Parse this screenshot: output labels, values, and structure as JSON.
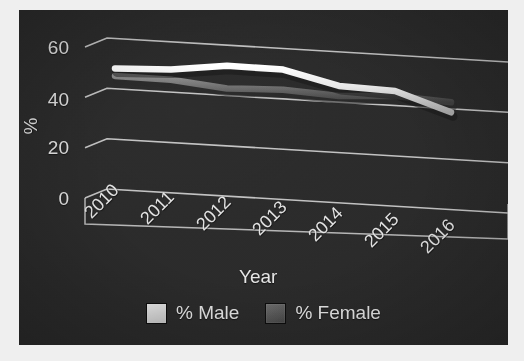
{
  "chart_data": {
    "type": "line",
    "title": "",
    "subtitle": "",
    "xlabel": "Year",
    "ylabel": "%",
    "categories": [
      "2010",
      "2011",
      "2012",
      "2013",
      "2014",
      "2015",
      "2016"
    ],
    "ylim": [
      0,
      60
    ],
    "yticks": [
      0,
      20,
      40,
      60
    ],
    "ytick_labels": [
      "0",
      "20",
      "40",
      "60"
    ],
    "grid": true,
    "three_d": true,
    "legend_position": "bottom",
    "series": [
      {
        "name": "% Male",
        "color": "#d9d9d9",
        "values": [
          51.5,
          52.0,
          54.5,
          54.0,
          48.5,
          47.5,
          40.0
        ]
      },
      {
        "name": "% Female",
        "color": "#606060",
        "values": [
          48.5,
          48.0,
          45.5,
          46.0,
          44.5,
          45.5,
          44.0
        ]
      }
    ],
    "annotations": []
  },
  "axes": {
    "y_title": "%",
    "x_title": "Year",
    "y_tick_labels": [
      "60",
      "40",
      "20",
      "0"
    ],
    "x_tick_labels": [
      "2010",
      "2011",
      "2012",
      "2013",
      "2014",
      "2015",
      "2016"
    ]
  },
  "legend": {
    "items": [
      {
        "label": "% Male",
        "color": "#d9d9d9"
      },
      {
        "label": "% Female",
        "color": "#5e5e5e"
      }
    ]
  },
  "colors": {
    "background": "#efefef",
    "plot_background": "#2b2b2b",
    "gridline": "#cfcfcf",
    "text": "#e2e2e2",
    "series_male": "#d9d9d9",
    "series_female": "#606060"
  }
}
